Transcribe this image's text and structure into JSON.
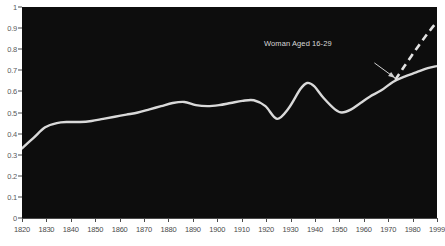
{
  "chart_data": {
    "type": "line",
    "title": "",
    "xlabel": "",
    "ylabel": "",
    "xlim": [
      1820,
      1999
    ],
    "ylim": [
      0,
      1
    ],
    "grid": false,
    "legend": "none",
    "background_color": "#0d0d0d",
    "line_color": "#d9d9d9",
    "axis_text_color": "#4a4a4a",
    "x_ticks": [
      "1820",
      "1830",
      "1840",
      "1850",
      "1860",
      "1870",
      "1880",
      "1890",
      "1900",
      "1910",
      "1920",
      "1930",
      "1940",
      "1950",
      "1960",
      "1970",
      "1980",
      "1999"
    ],
    "y_ticks": [
      "0",
      "0.1",
      "0.2",
      "0.3",
      "0.4",
      "0.5",
      "0.6",
      "0.7",
      "0.8",
      "0.9",
      "1"
    ],
    "y_tick_values": [
      0,
      0.1,
      0.2,
      0.3,
      0.4,
      0.5,
      0.6,
      0.7,
      0.8,
      0.9,
      1
    ],
    "series": [
      {
        "name": "main-solid-line",
        "style": "solid",
        "x": [
          1820,
          1825,
          1830,
          1835,
          1840,
          1845,
          1850,
          1855,
          1860,
          1865,
          1870,
          1875,
          1880,
          1885,
          1890,
          1895,
          1900,
          1905,
          1910,
          1915,
          1920,
          1925,
          1930,
          1935,
          1940,
          1943,
          1946,
          1950,
          1955,
          1958,
          1962,
          1966,
          1970,
          1975,
          1980,
          1985,
          1990,
          1995,
          1999
        ],
        "values": [
          0.33,
          0.38,
          0.43,
          0.45,
          0.455,
          0.455,
          0.46,
          0.47,
          0.48,
          0.49,
          0.5,
          0.515,
          0.53,
          0.545,
          0.55,
          0.535,
          0.53,
          0.535,
          0.545,
          0.555,
          0.558,
          0.53,
          0.47,
          0.52,
          0.61,
          0.64,
          0.625,
          0.57,
          0.515,
          0.5,
          0.515,
          0.545,
          0.575,
          0.605,
          0.645,
          0.67,
          0.69,
          0.71,
          0.72
        ]
      },
      {
        "name": "dashed-projection-line",
        "style": "dashed",
        "x": [
          1981,
          1985,
          1990,
          1995,
          1999
        ],
        "values": [
          0.655,
          0.72,
          0.8,
          0.875,
          0.93
        ]
      }
    ],
    "annotations": [
      {
        "text": "Woman Aged 16-29",
        "x": 1939,
        "y": 0.825,
        "arrow_from_x": 1972,
        "arrow_from_y": 0.735,
        "arrow_to_x": 1981,
        "arrow_to_y": 0.663
      }
    ]
  }
}
